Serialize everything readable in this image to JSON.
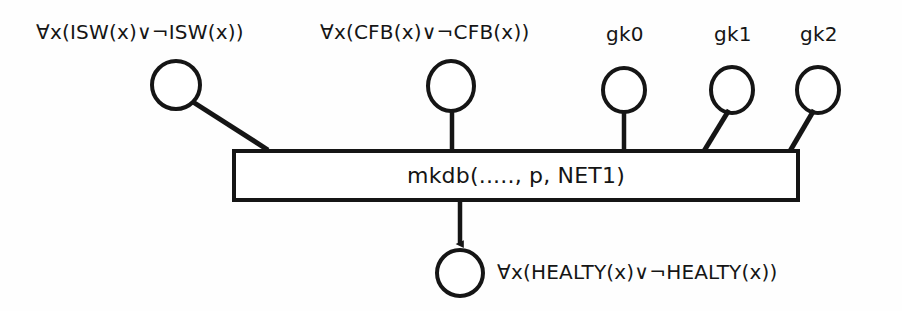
{
  "diagram": {
    "type": "petri-net",
    "colors": {
      "stroke": "#151515",
      "background": "#fefefe",
      "fill": "#ffffff"
    },
    "input_places": [
      {
        "id": "isw",
        "label": "∀x(ISW(x)∨¬ISW(x))",
        "shape": "circle",
        "cx": 176,
        "cy": 85,
        "r": 24,
        "arc": "diagonal"
      },
      {
        "id": "cfb",
        "label": "∀x(CFB(x)∨¬CFB(x))",
        "shape": "circle",
        "cx": 451,
        "cy": 86,
        "r": 24,
        "arc": "vertical"
      },
      {
        "id": "gk0",
        "label": "gk0",
        "shape": "circle",
        "cx": 624,
        "cy": 90,
        "r": 22,
        "arc": "vertical"
      },
      {
        "id": "gk1",
        "label": "gk1",
        "shape": "circle",
        "cx": 732,
        "cy": 90,
        "r": 22,
        "arc": "diagonal"
      },
      {
        "id": "gk2",
        "label": "gk2",
        "shape": "circle",
        "cx": 818,
        "cy": 90,
        "r": 22,
        "arc": "diagonal"
      }
    ],
    "transition": {
      "id": "mkdb",
      "label": "mkdb(....., p, NET1)",
      "x": 234,
      "y": 151,
      "width": 564,
      "height": 49
    },
    "output_place": {
      "id": "healty",
      "label": "∀x(HEALTY(x)∨¬HEALTY(x))",
      "shape": "circle",
      "cx": 460,
      "cy": 273,
      "r": 23,
      "arc": "arrow-down"
    }
  }
}
